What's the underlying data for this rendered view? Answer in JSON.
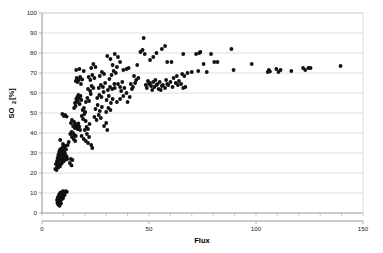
{
  "chart_data": {
    "type": "scatter",
    "title": "",
    "xlabel": "Flux",
    "ylabel": "SO2 [%]",
    "ylabel_main": "SO",
    "ylabel_sub": "2",
    "ylabel_unit": " [%]",
    "xlim": [
      0,
      150
    ],
    "ylim": [
      0,
      100
    ],
    "xticks": [
      0,
      50,
      100,
      150
    ],
    "xtick_labels": [
      "0",
      "50",
      "100",
      "150"
    ],
    "x_minor_tick_step": 10,
    "yticks": [
      0,
      10,
      20,
      30,
      40,
      50,
      60,
      70,
      80,
      90,
      100
    ],
    "ytick_labels": [
      "0",
      "10",
      "20",
      "30",
      "40",
      "50",
      "60",
      "70",
      "80",
      "90",
      "100"
    ],
    "grid": "horizontal",
    "legend": "none",
    "marker": "filled-circle",
    "marker_color": "#111111",
    "marker_size": 1.9,
    "series": [
      {
        "name": "SO2 vs Flux",
        "points": [
          [
            7.0,
            6.5
          ],
          [
            7.2,
            5.0
          ],
          [
            7.4,
            7.8
          ],
          [
            7.6,
            4.2
          ],
          [
            7.8,
            8.6
          ],
          [
            8.0,
            6.0
          ],
          [
            8.1,
            9.3
          ],
          [
            8.3,
            7.2
          ],
          [
            8.5,
            5.6
          ],
          [
            8.6,
            10.2
          ],
          [
            8.8,
            8.0
          ],
          [
            9.0,
            9.8
          ],
          [
            9.2,
            6.8
          ],
          [
            9.4,
            10.6
          ],
          [
            9.6,
            8.4
          ],
          [
            9.8,
            10.9
          ],
          [
            10.1,
            9.5
          ],
          [
            10.4,
            10.7
          ],
          [
            10.8,
            10.4
          ],
          [
            11.2,
            10.9
          ],
          [
            11.6,
            10.6
          ],
          [
            8.2,
            3.6
          ],
          [
            8.9,
            4.8
          ],
          [
            9.9,
            7.5
          ],
          [
            10.6,
            9.0
          ],
          [
            6.2,
            22.0
          ],
          [
            6.5,
            24.5
          ],
          [
            6.8,
            21.5
          ],
          [
            7.0,
            26.0
          ],
          [
            7.1,
            23.2
          ],
          [
            7.3,
            27.5
          ],
          [
            7.4,
            25.0
          ],
          [
            7.6,
            29.0
          ],
          [
            7.7,
            22.8
          ],
          [
            7.9,
            26.5
          ],
          [
            8.0,
            30.5
          ],
          [
            8.1,
            24.0
          ],
          [
            8.2,
            28.0
          ],
          [
            8.3,
            31.5
          ],
          [
            8.4,
            26.8
          ],
          [
            8.5,
            23.5
          ],
          [
            8.6,
            29.5
          ],
          [
            8.7,
            27.0
          ],
          [
            8.8,
            32.0
          ],
          [
            8.9,
            25.5
          ],
          [
            9.0,
            30.0
          ],
          [
            9.1,
            27.8
          ],
          [
            9.2,
            24.8
          ],
          [
            9.3,
            31.0
          ],
          [
            9.4,
            28.5
          ],
          [
            9.5,
            26.2
          ],
          [
            9.6,
            29.8
          ],
          [
            9.7,
            33.0
          ],
          [
            9.8,
            27.2
          ],
          [
            9.9,
            30.8
          ],
          [
            10.0,
            25.8
          ],
          [
            10.1,
            28.8
          ],
          [
            10.2,
            32.5
          ],
          [
            10.4,
            27.5
          ],
          [
            10.6,
            30.2
          ],
          [
            10.8,
            26.5
          ],
          [
            11.0,
            29.0
          ],
          [
            11.2,
            31.8
          ],
          [
            11.5,
            28.2
          ],
          [
            11.8,
            27.0
          ],
          [
            8.5,
            36.5
          ],
          [
            9.8,
            34.5
          ],
          [
            11.0,
            33.5
          ],
          [
            12.0,
            34.0
          ],
          [
            12.5,
            35.5
          ],
          [
            9.5,
            49.5
          ],
          [
            10.2,
            48.5
          ],
          [
            10.8,
            49.0
          ],
          [
            11.5,
            48.2
          ],
          [
            13.0,
            25.0
          ],
          [
            13.5,
            27.0
          ],
          [
            13.8,
            23.8
          ],
          [
            14.2,
            26.5
          ],
          [
            13.2,
            39.5
          ],
          [
            13.8,
            40.5
          ],
          [
            14.0,
            38.0
          ],
          [
            14.5,
            40.0
          ],
          [
            14.8,
            37.0
          ],
          [
            15.2,
            39.0
          ],
          [
            15.5,
            36.0
          ],
          [
            15.8,
            38.5
          ],
          [
            13.5,
            45.0
          ],
          [
            14.0,
            46.5
          ],
          [
            14.5,
            43.5
          ],
          [
            15.0,
            45.5
          ],
          [
            15.3,
            42.5
          ],
          [
            15.6,
            44.5
          ],
          [
            16.0,
            43.0
          ],
          [
            16.3,
            44.0
          ],
          [
            16.6,
            42.0
          ],
          [
            17.0,
            44.8
          ],
          [
            17.4,
            43.2
          ],
          [
            17.8,
            41.5
          ],
          [
            15.0,
            52.5
          ],
          [
            15.4,
            55.0
          ],
          [
            15.7,
            53.5
          ],
          [
            16.0,
            57.0
          ],
          [
            16.2,
            55.5
          ],
          [
            16.5,
            58.0
          ],
          [
            16.8,
            56.0
          ],
          [
            17.0,
            59.0
          ],
          [
            17.3,
            57.5
          ],
          [
            17.6,
            54.5
          ],
          [
            18.0,
            58.5
          ],
          [
            18.4,
            56.5
          ],
          [
            15.8,
            66.0
          ],
          [
            16.2,
            67.5
          ],
          [
            16.6,
            65.5
          ],
          [
            17.2,
            66.5
          ],
          [
            17.8,
            68.0
          ],
          [
            18.2,
            64.5
          ],
          [
            18.8,
            66.8
          ],
          [
            16.0,
            71.5
          ],
          [
            17.5,
            72.0
          ],
          [
            19.5,
            71.0
          ],
          [
            18.6,
            48.5
          ],
          [
            19.2,
            47.0
          ],
          [
            19.8,
            49.5
          ],
          [
            20.4,
            46.0
          ],
          [
            19.0,
            51.5
          ],
          [
            19.6,
            52.5
          ],
          [
            20.2,
            50.5
          ],
          [
            18.5,
            38.5
          ],
          [
            19.5,
            37.0
          ],
          [
            20.5,
            36.0
          ],
          [
            21.5,
            35.0
          ],
          [
            20.0,
            41.5
          ],
          [
            20.8,
            43.0
          ],
          [
            21.5,
            42.0
          ],
          [
            22.2,
            44.5
          ],
          [
            21.0,
            39.5
          ],
          [
            22.0,
            38.0
          ],
          [
            23.0,
            34.0
          ],
          [
            23.5,
            32.5
          ],
          [
            20.5,
            55.5
          ],
          [
            21.2,
            57.5
          ],
          [
            22.0,
            56.0
          ],
          [
            22.8,
            59.5
          ],
          [
            21.5,
            62.0
          ],
          [
            22.5,
            61.0
          ],
          [
            23.2,
            63.5
          ],
          [
            24.0,
            62.5
          ],
          [
            21.8,
            68.0
          ],
          [
            22.6,
            66.5
          ],
          [
            23.5,
            69.0
          ],
          [
            24.5,
            67.5
          ],
          [
            23.0,
            72.5
          ],
          [
            24.0,
            74.5
          ],
          [
            25.0,
            73.0
          ],
          [
            24.5,
            48.0
          ],
          [
            25.5,
            46.5
          ],
          [
            26.5,
            49.0
          ],
          [
            27.5,
            47.5
          ],
          [
            25.0,
            52.0
          ],
          [
            26.0,
            54.0
          ],
          [
            27.0,
            51.0
          ],
          [
            28.0,
            53.0
          ],
          [
            25.8,
            57.5
          ],
          [
            26.8,
            59.0
          ],
          [
            27.8,
            58.0
          ],
          [
            28.8,
            60.5
          ],
          [
            26.5,
            62.5
          ],
          [
            27.5,
            64.0
          ],
          [
            28.5,
            63.0
          ],
          [
            29.5,
            65.0
          ],
          [
            27.0,
            68.5
          ],
          [
            28.0,
            70.5
          ],
          [
            29.0,
            69.5
          ],
          [
            29.0,
            43.5
          ],
          [
            30.0,
            45.0
          ],
          [
            30.5,
            41.5
          ],
          [
            30.0,
            50.5
          ],
          [
            31.0,
            52.5
          ],
          [
            32.0,
            51.5
          ],
          [
            30.2,
            56.5
          ],
          [
            31.2,
            58.5
          ],
          [
            32.2,
            55.0
          ],
          [
            33.0,
            57.0
          ],
          [
            30.8,
            61.5
          ],
          [
            31.8,
            63.0
          ],
          [
            32.8,
            62.0
          ],
          [
            33.8,
            64.5
          ],
          [
            31.5,
            67.0
          ],
          [
            32.5,
            69.0
          ],
          [
            33.5,
            71.0
          ],
          [
            34.5,
            70.0
          ],
          [
            30.5,
            78.5
          ],
          [
            32.0,
            77.0
          ],
          [
            34.0,
            79.5
          ],
          [
            35.5,
            78.0
          ],
          [
            33.0,
            74.0
          ],
          [
            35.0,
            73.0
          ],
          [
            36.5,
            75.5
          ],
          [
            34.0,
            62.5
          ],
          [
            35.5,
            64.5
          ],
          [
            36.5,
            63.0
          ],
          [
            37.5,
            65.5
          ],
          [
            35.0,
            55.5
          ],
          [
            36.5,
            57.0
          ],
          [
            38.0,
            58.5
          ],
          [
            37.0,
            61.0
          ],
          [
            38.5,
            62.5
          ],
          [
            39.5,
            60.0
          ],
          [
            38.0,
            71.5
          ],
          [
            39.5,
            72.0
          ],
          [
            40.5,
            72.5
          ],
          [
            40.0,
            55.5
          ],
          [
            41.0,
            58.0
          ],
          [
            42.0,
            62.0
          ],
          [
            41.5,
            64.5
          ],
          [
            42.5,
            63.0
          ],
          [
            43.5,
            65.0
          ],
          [
            43.0,
            68.5
          ],
          [
            44.0,
            66.5
          ],
          [
            45.0,
            67.5
          ],
          [
            44.5,
            74.0
          ],
          [
            46.0,
            80.5
          ],
          [
            47.0,
            81.5
          ],
          [
            48.0,
            79.5
          ],
          [
            47.5,
            87.5
          ],
          [
            48.5,
            64.0
          ],
          [
            49.5,
            66.0
          ],
          [
            50.5,
            65.0
          ],
          [
            49.0,
            62.5
          ],
          [
            50.0,
            64.5
          ],
          [
            51.0,
            63.5
          ],
          [
            52.0,
            65.5
          ],
          [
            51.5,
            61.5
          ],
          [
            52.5,
            63.0
          ],
          [
            53.5,
            64.0
          ],
          [
            54.5,
            62.0
          ],
          [
            50.5,
            76.5
          ],
          [
            52.0,
            78.0
          ],
          [
            53.5,
            80.0
          ],
          [
            53.0,
            66.5
          ],
          [
            54.0,
            64.5
          ],
          [
            55.0,
            65.5
          ],
          [
            56.0,
            63.5
          ],
          [
            55.5,
            61.5
          ],
          [
            56.5,
            64.0
          ],
          [
            57.5,
            62.5
          ],
          [
            58.5,
            64.5
          ],
          [
            56.0,
            82.0
          ],
          [
            57.5,
            83.5
          ],
          [
            58.5,
            75.5
          ],
          [
            58.0,
            66.5
          ],
          [
            59.0,
            64.0
          ],
          [
            60.0,
            65.5
          ],
          [
            61.0,
            63.0
          ],
          [
            60.5,
            75.5
          ],
          [
            61.5,
            67.5
          ],
          [
            62.5,
            65.0
          ],
          [
            63.5,
            64.0
          ],
          [
            63.0,
            68.5
          ],
          [
            64.0,
            66.0
          ],
          [
            65.0,
            64.5
          ],
          [
            66.0,
            62.5
          ],
          [
            65.5,
            69.5
          ],
          [
            66.5,
            68.5
          ],
          [
            67.0,
            63.0
          ],
          [
            66.0,
            79.5
          ],
          [
            68.0,
            70.0
          ],
          [
            70.0,
            70.5
          ],
          [
            72.0,
            79.5
          ],
          [
            73.5,
            80.0
          ],
          [
            74.0,
            80.5
          ],
          [
            73.0,
            71.0
          ],
          [
            75.5,
            74.5
          ],
          [
            77.0,
            70.5
          ],
          [
            79.0,
            79.5
          ],
          [
            80.5,
            75.5
          ],
          [
            82.0,
            75.5
          ],
          [
            88.5,
            82.0
          ],
          [
            89.5,
            71.5
          ],
          [
            98.0,
            74.5
          ],
          [
            105.5,
            70.5
          ],
          [
            106.0,
            71.5
          ],
          [
            106.5,
            70.8
          ],
          [
            109.5,
            72.0
          ],
          [
            110.5,
            70.5
          ],
          [
            111.5,
            71.5
          ],
          [
            116.5,
            71.0
          ],
          [
            122.0,
            72.5
          ],
          [
            123.0,
            71.5
          ],
          [
            124.5,
            72.5
          ],
          [
            125.5,
            72.5
          ],
          [
            139.5,
            73.5
          ]
        ]
      }
    ]
  }
}
